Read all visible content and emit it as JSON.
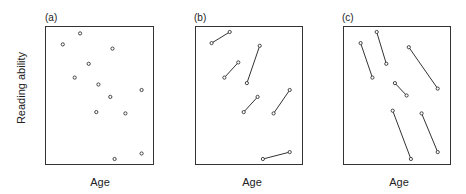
{
  "figure": {
    "ylabel": "Reading ability",
    "panels": [
      {
        "id": "a",
        "label": "(a)",
        "xlabel": "Age"
      },
      {
        "id": "b",
        "label": "(b)",
        "xlabel": "Age"
      },
      {
        "id": "c",
        "label": "(c)",
        "xlabel": "Age"
      }
    ]
  },
  "chart_data": [
    {
      "type": "scatter",
      "title": "(a)",
      "xlabel": "Age",
      "ylabel": "Reading ability",
      "axis_ticks": false,
      "grid": false,
      "note": "Coordinates are relative positions within plot box (0-1), y increasing upward; cross-sectional points with no connecting lines",
      "points": [
        {
          "x": 0.32,
          "y": 0.95
        },
        {
          "x": 0.16,
          "y": 0.87
        },
        {
          "x": 0.62,
          "y": 0.84
        },
        {
          "x": 0.4,
          "y": 0.73
        },
        {
          "x": 0.27,
          "y": 0.63
        },
        {
          "x": 0.49,
          "y": 0.58
        },
        {
          "x": 0.89,
          "y": 0.54
        },
        {
          "x": 0.6,
          "y": 0.49
        },
        {
          "x": 0.47,
          "y": 0.38
        },
        {
          "x": 0.74,
          "y": 0.37
        },
        {
          "x": 0.89,
          "y": 0.08
        },
        {
          "x": 0.64,
          "y": 0.04
        }
      ]
    },
    {
      "type": "line",
      "title": "(b)",
      "xlabel": "Age",
      "ylabel": "Reading ability",
      "axis_ticks": false,
      "grid": false,
      "note": "Paired longitudinal segments, each increasing with age",
      "segments": [
        {
          "x1": 0.15,
          "y1": 0.88,
          "x2": 0.32,
          "y2": 0.96
        },
        {
          "x1": 0.27,
          "y1": 0.63,
          "x2": 0.4,
          "y2": 0.74
        },
        {
          "x1": 0.48,
          "y1": 0.59,
          "x2": 0.6,
          "y2": 0.86
        },
        {
          "x1": 0.45,
          "y1": 0.38,
          "x2": 0.58,
          "y2": 0.49
        },
        {
          "x1": 0.73,
          "y1": 0.37,
          "x2": 0.88,
          "y2": 0.54
        },
        {
          "x1": 0.63,
          "y1": 0.04,
          "x2": 0.88,
          "y2": 0.09
        }
      ]
    },
    {
      "type": "line",
      "title": "(c)",
      "xlabel": "Age",
      "ylabel": "Reading ability",
      "axis_ticks": false,
      "grid": false,
      "note": "Paired longitudinal segments, each decreasing with age",
      "segments": [
        {
          "x1": 0.16,
          "y1": 0.88,
          "x2": 0.27,
          "y2": 0.63
        },
        {
          "x1": 0.31,
          "y1": 0.96,
          "x2": 0.4,
          "y2": 0.73
        },
        {
          "x1": 0.61,
          "y1": 0.85,
          "x2": 0.88,
          "y2": 0.55
        },
        {
          "x1": 0.48,
          "y1": 0.59,
          "x2": 0.59,
          "y2": 0.5
        },
        {
          "x1": 0.46,
          "y1": 0.39,
          "x2": 0.63,
          "y2": 0.04
        },
        {
          "x1": 0.73,
          "y1": 0.37,
          "x2": 0.88,
          "y2": 0.09
        }
      ]
    }
  ]
}
